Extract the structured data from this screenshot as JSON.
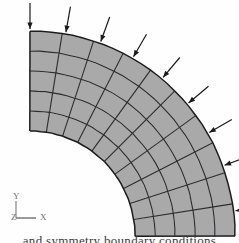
{
  "figure": {
    "name": "quarter-annulus-finite-element-mesh",
    "colors": {
      "element_fill": "#a9a9a9",
      "element_edge": "#2b2b2b",
      "outline": "#1c1c1c",
      "arrow": "#1a1a1a",
      "triad": "#6f6f6f",
      "background": "#fefefe",
      "caption_text": "#3a3a3a"
    }
  },
  "geometry": {
    "center_x": 30,
    "center_y": 236,
    "inner_radius": 105,
    "outer_radius": 205,
    "start_angle_deg": 0,
    "end_angle_deg": 90,
    "radial_divisions": 5,
    "circumferential_divisions": 10
  },
  "load": {
    "label": "pressure",
    "direction": "inward",
    "arrow_count": 9,
    "arrow_length": 26,
    "arrow_angles_deg": [
      90,
      80,
      70,
      60,
      50,
      40,
      30,
      20,
      7
    ]
  },
  "triad": {
    "x_label": "X",
    "y_label": "Y",
    "z_label": "Z",
    "origin_x": 16,
    "origin_y": 218
  },
  "caption": {
    "text": "and symmetry boundary conditions"
  }
}
